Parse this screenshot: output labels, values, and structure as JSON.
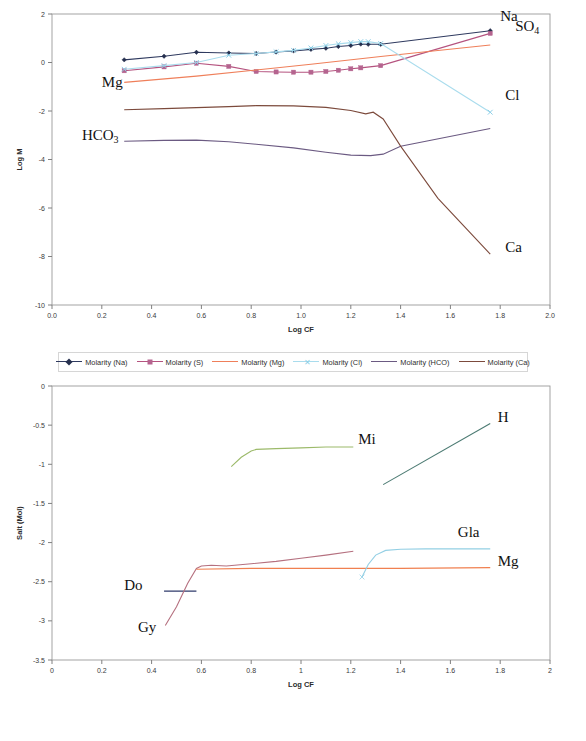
{
  "chart_data": [
    {
      "id": "chart1",
      "type": "line",
      "title": "",
      "xlabel": "Log CF",
      "ylabel": "Log M",
      "xlim": [
        0.0,
        2.0
      ],
      "ylim": [
        -10,
        2
      ],
      "xticks": [
        "0.0",
        "0.2",
        "0.4",
        "0.6",
        "0.8",
        "1.0",
        "1.2",
        "1.4",
        "1.6",
        "1.8",
        "2.0"
      ],
      "xtickvals": [
        0.0,
        0.2,
        0.4,
        0.6,
        0.8,
        1.0,
        1.2,
        1.4,
        1.6,
        1.8,
        2.0
      ],
      "yticks": [
        "2",
        "0",
        "-2",
        "-4",
        "-6",
        "-8",
        "-10"
      ],
      "ytickvals": [
        2,
        0,
        -2,
        -4,
        -6,
        -8,
        -10
      ],
      "grid": false,
      "legend_position": "bottom",
      "series": [
        {
          "name": "Molarity  (Na)",
          "color": "#2f3a5f",
          "marker": "diamond",
          "marker_color": "#26304f",
          "annotation": "Na",
          "x": [
            0.29,
            0.45,
            0.58,
            0.71,
            0.82,
            0.9,
            0.97,
            1.04,
            1.1,
            1.15,
            1.2,
            1.24,
            1.27,
            1.32,
            1.76
          ],
          "y": [
            0.11,
            0.26,
            0.42,
            0.39,
            0.37,
            0.43,
            0.48,
            0.54,
            0.59,
            0.66,
            0.7,
            0.76,
            0.75,
            0.75,
            1.31
          ]
        },
        {
          "name": "Molarity (S)",
          "color": "#b5537f",
          "marker": "square",
          "marker_color": "#b5648f",
          "annotation": "SO4",
          "x": [
            0.29,
            0.45,
            0.58,
            0.71,
            0.82,
            0.9,
            0.97,
            1.04,
            1.1,
            1.15,
            1.2,
            1.24,
            1.32,
            1.76
          ],
          "y": [
            -0.34,
            -0.18,
            -0.03,
            -0.16,
            -0.37,
            -0.39,
            -0.4,
            -0.4,
            -0.37,
            -0.32,
            -0.26,
            -0.22,
            -0.13,
            1.2
          ]
        },
        {
          "name": "Molarity (Mg)",
          "color": "#ef7f5a",
          "marker": "none",
          "marker_color": "#ef7f5a",
          "annotation": "Mg",
          "x": [
            0.29,
            0.58,
            0.82,
            1.04,
            1.32,
            1.76
          ],
          "y": [
            -0.82,
            -0.56,
            -0.31,
            -0.07,
            0.25,
            0.72
          ]
        },
        {
          "name": "Molarity (Cl)",
          "color": "#a9dced",
          "marker": "x",
          "marker_color": "#8fd0e8",
          "annotation": "Cl",
          "x": [
            0.29,
            0.45,
            0.58,
            0.71,
            0.82,
            0.9,
            0.97,
            1.04,
            1.1,
            1.15,
            1.2,
            1.24,
            1.27,
            1.32,
            1.76
          ],
          "y": [
            -0.28,
            -0.13,
            0.0,
            0.3,
            0.37,
            0.44,
            0.5,
            0.6,
            0.7,
            0.77,
            0.82,
            0.86,
            0.86,
            0.78,
            -2.05
          ]
        },
        {
          "name": "Molarity (HCO)",
          "color": "#6b5a82",
          "marker": "none",
          "marker_color": "#6b5a82",
          "annotation": "HCO3",
          "x": [
            0.29,
            0.45,
            0.58,
            0.71,
            0.82,
            0.97,
            1.1,
            1.2,
            1.28,
            1.33,
            1.4,
            1.76
          ],
          "y": [
            -3.25,
            -3.21,
            -3.2,
            -3.27,
            -3.37,
            -3.52,
            -3.7,
            -3.82,
            -3.84,
            -3.78,
            -3.45,
            -2.72
          ]
        },
        {
          "name": "Molarity (Ca)",
          "color": "#7c4a3c",
          "marker": "none",
          "marker_color": "#7c4a3c",
          "annotation": "Ca",
          "x": [
            0.29,
            0.45,
            0.58,
            0.71,
            0.82,
            0.97,
            1.1,
            1.2,
            1.26,
            1.29,
            1.33,
            1.4,
            1.55,
            1.76
          ],
          "y": [
            -1.95,
            -1.9,
            -1.86,
            -1.82,
            -1.78,
            -1.79,
            -1.85,
            -1.98,
            -2.12,
            -2.05,
            -2.33,
            -3.45,
            -5.6,
            -7.9
          ]
        }
      ],
      "annotations": [
        {
          "text": "Na",
          "x": 1.8,
          "y": 1.72,
          "anchor": "start"
        },
        {
          "text": "SO",
          "sub": "4",
          "x": 1.86,
          "y": 1.3,
          "anchor": "start"
        },
        {
          "text": "Cl",
          "x": 1.82,
          "y": -1.55,
          "anchor": "start"
        },
        {
          "text": "Ca",
          "x": 1.82,
          "y": -7.8,
          "anchor": "start"
        },
        {
          "text": "Mg",
          "x": 0.2,
          "y": -1.0,
          "anchor": "start"
        },
        {
          "text": "HCO",
          "sub": "3",
          "x": 0.12,
          "y": -3.2,
          "anchor": "start"
        }
      ]
    },
    {
      "id": "chart2",
      "type": "line",
      "title": "",
      "xlabel": "Log CF",
      "ylabel": "Salt (Mol)",
      "xlim": [
        0.0,
        2.0
      ],
      "ylim": [
        -3.5,
        0
      ],
      "xticks": [
        "0",
        "0.2",
        "0.4",
        "0.6",
        "0.8",
        "1",
        "1.2",
        "1.4",
        "1.6",
        "1.8",
        "2"
      ],
      "xtickvals": [
        0.0,
        0.2,
        0.4,
        0.6,
        0.8,
        1.0,
        1.2,
        1.4,
        1.6,
        1.8,
        2.0
      ],
      "yticks": [
        "0",
        "-0.5",
        "-1",
        "-1.5",
        "-2",
        "-2.5",
        "-3",
        "-3.5"
      ],
      "ytickvals": [
        0,
        -0.5,
        -1,
        -1.5,
        -2,
        -2.5,
        -3,
        -3.5
      ],
      "grid": false,
      "legend_position": "bottom",
      "series": [
        {
          "name": "Dolomite",
          "color": "#2f3a6b",
          "marker": "none",
          "marker_color": "#2f3a6b",
          "annotation": "Do",
          "x": [
            0.45,
            0.58
          ],
          "y": [
            -2.62,
            -2.62
          ]
        },
        {
          "name": "Gypsum",
          "color": "#b5707f",
          "marker": "none",
          "marker_color": "#b5707f",
          "annotation": "Gy",
          "x": [
            0.455,
            0.5,
            0.545,
            0.58,
            0.6,
            0.64,
            0.7,
            0.8,
            0.9,
            1.0,
            1.1,
            1.21
          ],
          "y": [
            -3.06,
            -2.82,
            -2.52,
            -2.33,
            -2.3,
            -2.29,
            -2.3,
            -2.27,
            -2.24,
            -2.2,
            -2.16,
            -2.11
          ]
        },
        {
          "name": "Magnésite",
          "color": "#f08050",
          "marker": "none",
          "marker_color": "#f08050",
          "annotation": "Mg",
          "x": [
            0.58,
            0.8,
            1.1,
            1.4,
            1.76
          ],
          "y": [
            -2.34,
            -2.33,
            -2.33,
            -2.33,
            -2.32
          ]
        },
        {
          "name": "Anhydrite",
          "color": "#a9dced",
          "marker": "x",
          "marker_color": "#a9dced",
          "annotation": "",
          "x": [
            1.245
          ],
          "y": [
            -2.44
          ]
        },
        {
          "name": "Glauberite",
          "color": "#93cfe4",
          "marker": "none",
          "marker_color": "#93cfe4",
          "annotation": "Gla",
          "x": [
            1.245,
            1.27,
            1.3,
            1.34,
            1.4,
            1.5,
            1.6,
            1.76
          ],
          "y": [
            -2.44,
            -2.28,
            -2.16,
            -2.1,
            -2.085,
            -2.08,
            -2.08,
            -2.08
          ]
        },
        {
          "name": "Mirabilite",
          "color": "#9cba6a",
          "marker": "none",
          "marker_color": "#9cba6a",
          "annotation": "Mi",
          "x": [
            0.72,
            0.76,
            0.8,
            0.82,
            0.9,
            1.0,
            1.1,
            1.21
          ],
          "y": [
            -1.03,
            -0.91,
            -0.83,
            -0.81,
            -0.8,
            -0.79,
            -0.78,
            -0.78
          ]
        },
        {
          "name": "Halite",
          "color": "#4b7a72",
          "marker": "none",
          "marker_color": "#4b7a72",
          "annotation": "H",
          "x": [
            1.33,
            1.76
          ],
          "y": [
            -1.26,
            -0.48
          ]
        }
      ],
      "annotations": [
        {
          "text": "Mi",
          "x": 1.23,
          "y": -0.74,
          "anchor": "start"
        },
        {
          "text": "H",
          "x": 1.79,
          "y": -0.46,
          "anchor": "start"
        },
        {
          "text": "Gla",
          "x": 1.63,
          "y": -1.93,
          "anchor": "start"
        },
        {
          "text": "Mg",
          "x": 1.79,
          "y": -2.3,
          "anchor": "start"
        },
        {
          "text": "Do",
          "x": 0.29,
          "y": -2.6,
          "anchor": "start"
        },
        {
          "text": "Gy",
          "x": 0.345,
          "y": -3.14,
          "anchor": "start"
        }
      ]
    }
  ]
}
